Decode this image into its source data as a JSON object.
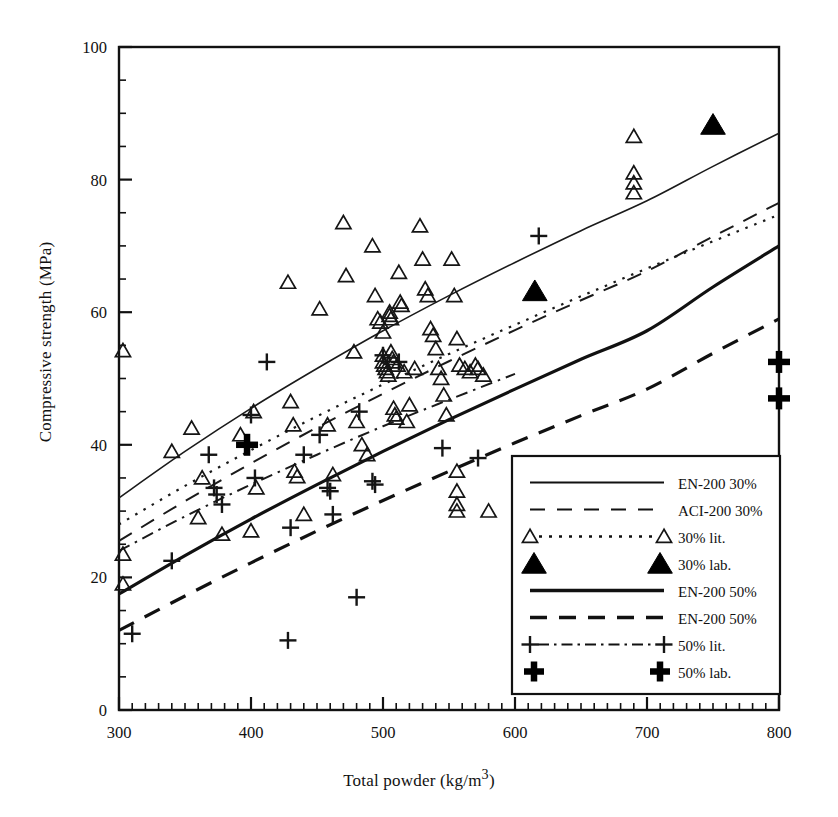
{
  "chart_data": {
    "type": "scatter",
    "title": "",
    "xlabel": "Total powder (kg/m3)",
    "xlabel_display": "Total powder (kg/m³)",
    "ylabel": "Compressive strength (MPa)",
    "xlim": [
      300,
      800
    ],
    "ylim": [
      0,
      100
    ],
    "x_major_ticks": [
      300,
      400,
      500,
      600,
      700,
      800
    ],
    "y_major_ticks": [
      0,
      20,
      40,
      60,
      80,
      100
    ],
    "x_minor_step": 10,
    "y_minor_step": 5,
    "grid": false,
    "legend_position": "bottom-right",
    "series": [
      {
        "name": "EN-200 30%",
        "key": "en200_30",
        "style": "solid-thin",
        "color": "#1a1a1a",
        "width": 1.6,
        "curve": [
          [
            300,
            32.0
          ],
          [
            350,
            39.0
          ],
          [
            400,
            45.5
          ],
          [
            450,
            51.5
          ],
          [
            500,
            57.2
          ],
          [
            550,
            62.5
          ],
          [
            600,
            67.5
          ],
          [
            650,
            72.3
          ],
          [
            700,
            76.8
          ],
          [
            750,
            82.0
          ],
          [
            800,
            87.0
          ]
        ]
      },
      {
        "name": "ACI-200 30%",
        "key": "aci200_30",
        "style": "dashed-thin",
        "color": "#1a1a1a",
        "width": 2.0,
        "curve": [
          [
            300,
            25.5
          ],
          [
            350,
            31.5
          ],
          [
            400,
            37.2
          ],
          [
            450,
            42.6
          ],
          [
            500,
            47.7
          ],
          [
            550,
            52.6
          ],
          [
            600,
            57.3
          ],
          [
            650,
            61.8
          ],
          [
            700,
            66.2
          ],
          [
            750,
            71.4
          ],
          [
            800,
            76.5
          ]
        ]
      },
      {
        "name": "30% lit.",
        "key": "lit_30",
        "style": "dotted-marker-triangle",
        "color": "#1a1a1a",
        "width": 2.2,
        "curve": [
          [
            300,
            28.0
          ],
          [
            350,
            33.8
          ],
          [
            400,
            39.2
          ],
          [
            450,
            44.3
          ],
          [
            500,
            49.1
          ],
          [
            550,
            53.7
          ],
          [
            600,
            58.1
          ],
          [
            650,
            62.4
          ],
          [
            700,
            66.6
          ],
          [
            750,
            70.7
          ],
          [
            800,
            74.7
          ]
        ]
      },
      {
        "name": "30% lab.",
        "key": "lab_30",
        "style": "marker-filled-triangle",
        "color": "#000000",
        "points": [
          [
            615,
            63.2
          ],
          [
            750,
            88.3
          ]
        ]
      },
      {
        "name": "EN-200 50%",
        "key": "en200_50_solid",
        "style": "solid-thick",
        "color": "#111111",
        "width": 3.2,
        "curve": [
          [
            300,
            17.5
          ],
          [
            350,
            23.3
          ],
          [
            400,
            28.8
          ],
          [
            450,
            34.0
          ],
          [
            500,
            39.0
          ],
          [
            550,
            43.8
          ],
          [
            600,
            48.4
          ],
          [
            650,
            52.9
          ],
          [
            700,
            57.2
          ],
          [
            750,
            63.8
          ],
          [
            800,
            70.0
          ]
        ]
      },
      {
        "name": "EN-200 50%",
        "key": "en200_50_dashed",
        "style": "dashed-thick",
        "color": "#111111",
        "width": 3.2,
        "curve": [
          [
            300,
            12.0
          ],
          [
            350,
            17.2
          ],
          [
            400,
            22.2
          ],
          [
            450,
            27.0
          ],
          [
            500,
            31.6
          ],
          [
            550,
            36.0
          ],
          [
            600,
            40.3
          ],
          [
            650,
            44.4
          ],
          [
            700,
            48.4
          ],
          [
            750,
            53.8
          ],
          [
            800,
            59.0
          ]
        ]
      },
      {
        "name": "50% lit.",
        "key": "lit_50",
        "style": "dashdot-marker-cross",
        "color": "#1a1a1a",
        "width": 2.0,
        "curve": [
          [
            300,
            24.0
          ],
          [
            350,
            29.2
          ],
          [
            400,
            34.0
          ],
          [
            450,
            38.5
          ],
          [
            500,
            42.8
          ],
          [
            550,
            46.8
          ],
          [
            600,
            50.7
          ]
        ]
      },
      {
        "name": "50% lab.",
        "key": "lab_50",
        "style": "marker-bold-cross",
        "color": "#000000",
        "points": [
          [
            397,
            40.0
          ],
          [
            800,
            52.5
          ],
          [
            800,
            47.0
          ]
        ]
      }
    ],
    "scatter_triangles_30_lit": [
      [
        303,
        54.2
      ],
      [
        303,
        23.5
      ],
      [
        303,
        19.0
      ],
      [
        340,
        39.0
      ],
      [
        355,
        42.5
      ],
      [
        360,
        29.0
      ],
      [
        363,
        35.0
      ],
      [
        378,
        26.5
      ],
      [
        392,
        41.5
      ],
      [
        400,
        27.0
      ],
      [
        402,
        45.0
      ],
      [
        404,
        33.5
      ],
      [
        428,
        64.5
      ],
      [
        430,
        46.5
      ],
      [
        432,
        43.0
      ],
      [
        433,
        36.0
      ],
      [
        435,
        35.2
      ],
      [
        440,
        29.5
      ],
      [
        452,
        60.5
      ],
      [
        458,
        43.0
      ],
      [
        462,
        35.5
      ],
      [
        470,
        73.5
      ],
      [
        472,
        65.5
      ],
      [
        478,
        54.0
      ],
      [
        480,
        43.5
      ],
      [
        484,
        40.0
      ],
      [
        488,
        38.5
      ],
      [
        492,
        70.0
      ],
      [
        494,
        62.5
      ],
      [
        496,
        59.0
      ],
      [
        498,
        58.5
      ],
      [
        500,
        57.0
      ],
      [
        500,
        53.5
      ],
      [
        500,
        52.5
      ],
      [
        501,
        52.0
      ],
      [
        502,
        51.5
      ],
      [
        503,
        51.0
      ],
      [
        504,
        50.5
      ],
      [
        505,
        60.0
      ],
      [
        505,
        59.5
      ],
      [
        506,
        59.0
      ],
      [
        506,
        54.0
      ],
      [
        507,
        53.0
      ],
      [
        508,
        52.5
      ],
      [
        508,
        45.5
      ],
      [
        509,
        44.5
      ],
      [
        510,
        44.0
      ],
      [
        511,
        52.0
      ],
      [
        512,
        66.0
      ],
      [
        513,
        61.5
      ],
      [
        514,
        61.0
      ],
      [
        516,
        51.0
      ],
      [
        518,
        43.5
      ],
      [
        520,
        46.0
      ],
      [
        524,
        51.5
      ],
      [
        528,
        73.0
      ],
      [
        530,
        68.0
      ],
      [
        532,
        63.5
      ],
      [
        534,
        62.5
      ],
      [
        536,
        57.5
      ],
      [
        538,
        56.5
      ],
      [
        540,
        54.5
      ],
      [
        542,
        51.5
      ],
      [
        544,
        50.0
      ],
      [
        546,
        47.5
      ],
      [
        548,
        44.5
      ],
      [
        552,
        68.0
      ],
      [
        554,
        62.5
      ],
      [
        556,
        56.0
      ],
      [
        556,
        36.0
      ],
      [
        556,
        33.0
      ],
      [
        556,
        31.0
      ],
      [
        556,
        30.0
      ],
      [
        558,
        52.0
      ],
      [
        562,
        51.5
      ],
      [
        566,
        51.0
      ],
      [
        570,
        52.0
      ],
      [
        572,
        51.5
      ],
      [
        576,
        50.5
      ],
      [
        580,
        30.0
      ],
      [
        690,
        86.5
      ],
      [
        690,
        81.0
      ],
      [
        690,
        79.5
      ],
      [
        690,
        78.0
      ]
    ],
    "scatter_crosses_50_lit": [
      [
        310,
        11.5
      ],
      [
        340,
        22.5
      ],
      [
        368,
        38.5
      ],
      [
        372,
        33.5
      ],
      [
        374,
        32.5
      ],
      [
        378,
        31.0
      ],
      [
        400,
        44.5
      ],
      [
        403,
        35.0
      ],
      [
        412,
        52.5
      ],
      [
        428,
        10.5
      ],
      [
        430,
        27.5
      ],
      [
        440,
        38.5
      ],
      [
        452,
        41.5
      ],
      [
        458,
        33.5
      ],
      [
        460,
        33.0
      ],
      [
        462,
        29.5
      ],
      [
        480,
        17.0
      ],
      [
        482,
        45.0
      ],
      [
        492,
        34.5
      ],
      [
        494,
        34.0
      ],
      [
        500,
        53.5
      ],
      [
        512,
        52.5
      ],
      [
        545,
        39.5
      ],
      [
        572,
        38.0
      ],
      [
        618,
        71.5
      ]
    ],
    "legend": {
      "items": [
        {
          "label": "EN-200 30%",
          "style": "solid-thin"
        },
        {
          "label": "ACI-200 30%",
          "style": "dashed-thin"
        },
        {
          "label": "30% lit.",
          "style": "dotted-marker-triangle"
        },
        {
          "label": "30% lab.",
          "style": "marker-filled-triangle"
        },
        {
          "label": "EN-200 50%",
          "style": "solid-thick"
        },
        {
          "label": "EN-200 50%",
          "style": "dashed-thick"
        },
        {
          "label": "50% lit.",
          "style": "dashdot-marker-cross"
        },
        {
          "label": "50% lab.",
          "style": "marker-bold-cross"
        }
      ]
    }
  }
}
